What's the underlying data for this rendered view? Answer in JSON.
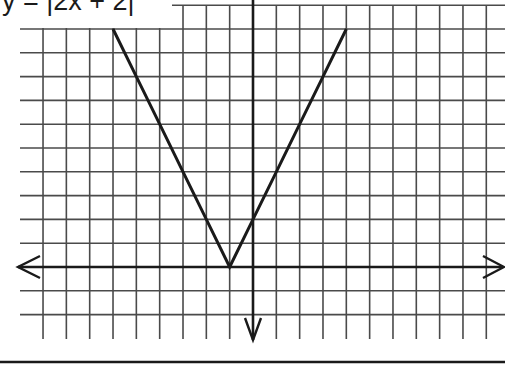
{
  "chart_data": {
    "type": "line",
    "title": "y = |2x + 2|",
    "xlabel": "",
    "ylabel": "",
    "grid": true,
    "xlim": [
      -9,
      10
    ],
    "ylim": [
      -3,
      11
    ],
    "axes": {
      "x_arrows": "both",
      "y_arrows": "both"
    },
    "series": [
      {
        "name": "y = |2x + 2|",
        "x": [
          -6,
          -5,
          -4,
          -3,
          -2,
          -1,
          0,
          1,
          2,
          3,
          4
        ],
        "y": [
          10,
          8,
          6,
          4,
          2,
          0,
          2,
          4,
          6,
          8,
          10
        ]
      }
    ],
    "vertex": {
      "x": -1,
      "y": 0
    },
    "y_intercept": 2
  },
  "colors": {
    "grid": "#4a4a4a",
    "axis": "#1a1a1a",
    "curve": "#1a1a1a",
    "background": "#ffffff"
  },
  "layout": {
    "origin_px": [
      253,
      267
    ],
    "unit_x_px": 23.33,
    "unit_y_px": 23.8,
    "grid_x_range": [
      -9,
      10
    ],
    "grid_y_range": [
      -3,
      11
    ]
  }
}
